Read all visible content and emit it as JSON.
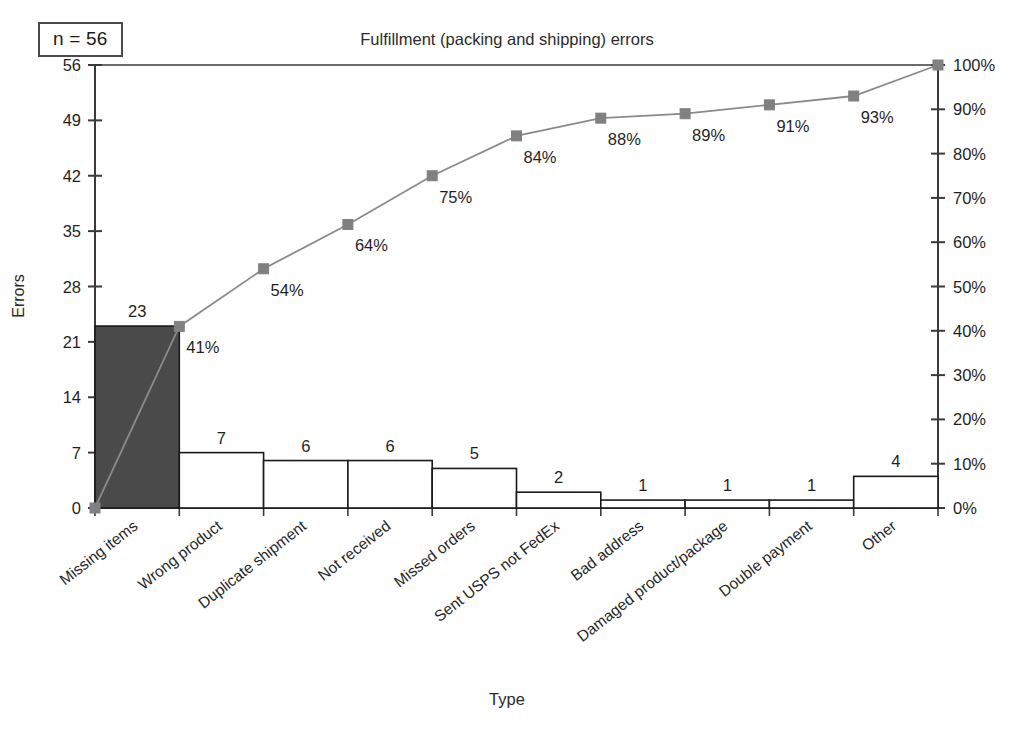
{
  "annotation": {
    "sample_size_label": "n = 56"
  },
  "axis": {
    "ylabel_left": "Errors",
    "xlabel": "Type",
    "left_ticks": [
      "0",
      "7",
      "14",
      "21",
      "28",
      "35",
      "42",
      "49",
      "56"
    ],
    "right_ticks": [
      "0%",
      "10%",
      "20%",
      "30%",
      "40%",
      "50%",
      "60%",
      "70%",
      "80%",
      "90%",
      "100%"
    ]
  },
  "colors": {
    "highlight_bar": "#4a4a4a",
    "bar_fill": "#ffffff",
    "bar_stroke": "#1a1a1a",
    "line": "#8a8a8a",
    "marker": "#808080",
    "axis": "#3a3a3a",
    "text": "#1a1a1a"
  },
  "chart_data": {
    "type": "bar",
    "title": "Fulfillment (packing and shipping) errors",
    "xlabel": "Type",
    "ylabel": "Errors",
    "ylim": [
      0,
      56
    ],
    "y2lim": [
      0,
      100
    ],
    "grid": false,
    "legend": null,
    "categories": [
      "Missing items",
      "Wrong product",
      "Duplicate shipment",
      "Not received",
      "Missed orders",
      "Sent USPS not FedEx",
      "Bad address",
      "Damaged product/package",
      "Double payment",
      "Other"
    ],
    "values": [
      23,
      7,
      6,
      6,
      5,
      2,
      1,
      1,
      1,
      4
    ],
    "value_labels": [
      "23",
      "7",
      "6",
      "6",
      "5",
      "2",
      "1",
      "1",
      "1",
      "4"
    ],
    "cumulative_percent": [
      41,
      54,
      64,
      75,
      84,
      88,
      89,
      91,
      93,
      100
    ],
    "cumulative_labels": [
      "41%",
      "54%",
      "64%",
      "75%",
      "84%",
      "88%",
      "89%",
      "91%",
      "93%",
      "100%"
    ],
    "highlighted_bar_index": 0,
    "total": 56,
    "annotation": "n = 56"
  }
}
